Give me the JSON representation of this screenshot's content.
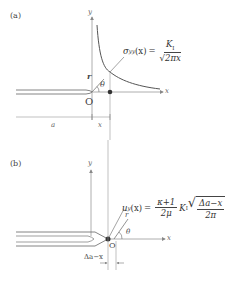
{
  "panel_a": {
    "tag": "(a)",
    "axis_y": "y",
    "axis_x": "x",
    "origin": "O",
    "r": "r",
    "theta": "θ",
    "dim_a": "a",
    "dim_x": "x",
    "formula": {
      "lhs": "σyy(x)",
      "lhs_sigma": "σ",
      "lhs_sub": "yy",
      "lhs_arg": "(x)",
      "equals": "=",
      "num": "K",
      "num_sub": "I",
      "den_root": "√",
      "den": "2πx"
    }
  },
  "panel_b": {
    "tag": "(b)",
    "axis_y": "y",
    "axis_x": "x",
    "origin": "O",
    "r": "r",
    "theta": "θ",
    "dim": "Δa−x",
    "formula": {
      "lhs_u": "u",
      "lhs_sub": "y",
      "lhs_arg": "(x)",
      "equals": "=",
      "frac_num": "κ+1",
      "frac_den": "2μ",
      "k": "K",
      "k_sub": "I",
      "root_num": "Δa−x",
      "root_den": "2π"
    }
  }
}
